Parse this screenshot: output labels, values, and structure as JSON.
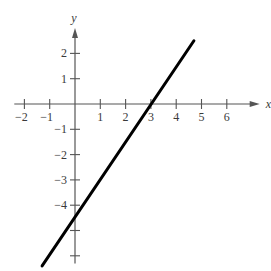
{
  "chart_data": {
    "type": "line",
    "title": "",
    "xlabel": "x",
    "ylabel": "y",
    "xlim": [
      -2.4,
      7.3
    ],
    "ylim": [
      -6.3,
      3.0
    ],
    "grid": false,
    "legend": null,
    "x_ticks": [
      -2,
      -1,
      1,
      2,
      3,
      4,
      5,
      6
    ],
    "x_tick_labels": [
      "−2",
      "−1",
      "1",
      "2",
      "3",
      "4",
      "5",
      "6"
    ],
    "y_ticks": [
      2,
      1,
      -1,
      -2,
      -3,
      -4,
      -5,
      -6
    ],
    "y_tick_labels": [
      "2",
      "1",
      "−1",
      "−2",
      "−3",
      "−4",
      "",
      ""
    ],
    "series": [
      {
        "name": "line",
        "equation": "y = 1.5x - 4.5",
        "x": [
          -1.3,
          4.7
        ],
        "y": [
          -6.4,
          2.5
        ],
        "x_intercept": 3,
        "y_intercept": -4.5,
        "color": "#000000"
      }
    ]
  },
  "layout": {
    "origin_px": [
      75,
      104
    ],
    "unit_px": 25.3,
    "axis_color": "#555555",
    "line_color": "#000000"
  }
}
